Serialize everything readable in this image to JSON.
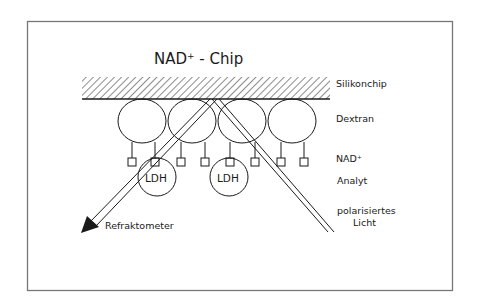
{
  "diagram": {
    "title_main": "NAD",
    "title_sup": "+",
    "title_rest": " - Chip",
    "labels": {
      "silikonchip": "Silikonchip",
      "dextran": "Dextran",
      "nad_main": "NAD",
      "nad_sup": "+",
      "analyt": "Analyt",
      "polarized_line1": "polarisiertes",
      "polarized_line2": "Licht",
      "refraktometer": "Refraktometer",
      "ldh_1": "LDH",
      "ldh_2": "LDH"
    },
    "colors": {
      "ink": "#1a1a1a",
      "frame": "#777777",
      "background": "#ffffff"
    },
    "structure": {
      "dextran_cells": 4,
      "nad_squares": 8,
      "ldh_analytes": 2,
      "light_beams": [
        "incident polarized light",
        "reflected to refractometer"
      ]
    }
  }
}
